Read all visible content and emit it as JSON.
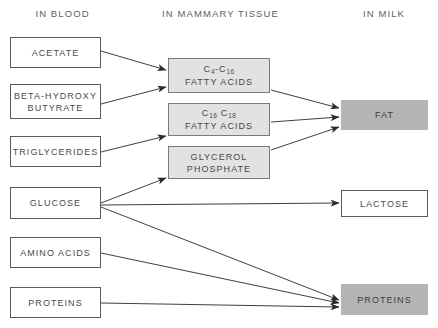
{
  "diagram": {
    "title_columns": [
      {
        "id": "in-blood",
        "label": "IN BLOOD",
        "x": 15,
        "y": 8,
        "w": 95
      },
      {
        "id": "in-mammary-tissue",
        "label": "IN MAMMARY TISSUE",
        "x": 148,
        "y": 8,
        "w": 145
      },
      {
        "id": "in-milk",
        "label": "IN MILK",
        "x": 338,
        "y": 8,
        "w": 92
      }
    ],
    "blood_nodes": [
      {
        "id": "acetate",
        "label": "ACETATE",
        "line2": "",
        "x": 10,
        "y": 37,
        "w": 91,
        "h": 31
      },
      {
        "id": "beta-hydroxy-butyrate",
        "label": "BETA-HYDROXY",
        "line2": "BUTYRATE",
        "x": 10,
        "y": 84,
        "w": 91,
        "h": 35
      },
      {
        "id": "triglycerides",
        "label": "TRIGLYCERIDES",
        "line2": "",
        "x": 10,
        "y": 136,
        "w": 91,
        "h": 31
      },
      {
        "id": "glucose",
        "label": "GLUCOSE",
        "line2": "",
        "x": 10,
        "y": 187,
        "w": 91,
        "h": 32
      },
      {
        "id": "amino-acids",
        "label": "AMINO ACIDS",
        "line2": "",
        "x": 10,
        "y": 237,
        "w": 91,
        "h": 31
      },
      {
        "id": "proteins-blood",
        "label": "PROTEINS",
        "line2": "",
        "x": 10,
        "y": 287,
        "w": 91,
        "h": 31
      }
    ],
    "tissue_nodes": [
      {
        "id": "c4-c16-fatty-acids",
        "label_html": "C<sub>4</sub>-C<sub>16</sub>",
        "line2": "FATTY ACIDS",
        "x": 168,
        "y": 58,
        "w": 102,
        "h": 35
      },
      {
        "id": "c16-c18-fatty-acids",
        "label_html": "C<sub>16</sub> C<sub>18</sub>",
        "line2": "FATTY ACIDS",
        "x": 168,
        "y": 103,
        "w": 102,
        "h": 33
      },
      {
        "id": "glycerol-phosphate",
        "label_html": "GLYCEROL",
        "line2": "PHOSPHATE",
        "x": 168,
        "y": 146,
        "w": 102,
        "h": 33
      }
    ],
    "milk_nodes": [
      {
        "id": "fat",
        "label": "FAT",
        "filled": true,
        "x": 341,
        "y": 100,
        "w": 87,
        "h": 30
      },
      {
        "id": "lactose",
        "label": "LACTOSE",
        "filled": false,
        "x": 341,
        "y": 190,
        "w": 87,
        "h": 27
      },
      {
        "id": "proteins-milk",
        "label": "PROTEINS",
        "filled": true,
        "x": 341,
        "y": 284,
        "w": 87,
        "h": 31
      }
    ],
    "edges": [
      {
        "id": "acetate-to-c4c16",
        "from": "acetate",
        "to": "c4-c16-fatty-acids",
        "x1": 101,
        "y1": 51,
        "x2": 166,
        "y2": 70
      },
      {
        "id": "beta-hydroxy-to-c4c16",
        "from": "beta-hydroxy-butyrate",
        "to": "c4-c16-fatty-acids",
        "x1": 101,
        "y1": 104,
        "x2": 166,
        "y2": 87
      },
      {
        "id": "triglycerides-to-c16c18",
        "from": "triglycerides",
        "to": "c16-c18-fatty-acids",
        "x1": 101,
        "y1": 152,
        "x2": 166,
        "y2": 136
      },
      {
        "id": "glucose-to-glycerol-phosphate",
        "from": "glucose",
        "to": "glycerol-phosphate",
        "x1": 101,
        "y1": 203,
        "x2": 166,
        "y2": 178
      },
      {
        "id": "c4c16-to-fat",
        "from": "c4-c16-fatty-acids",
        "to": "fat",
        "x1": 271,
        "y1": 90,
        "x2": 339,
        "y2": 108
      },
      {
        "id": "c16c18-to-fat",
        "from": "c16-c18-fatty-acids",
        "to": "fat",
        "x1": 271,
        "y1": 122,
        "x2": 339,
        "y2": 117
      },
      {
        "id": "glycerol-phosphate-to-fat",
        "from": "glycerol-phosphate",
        "to": "fat",
        "x1": 271,
        "y1": 150,
        "x2": 339,
        "y2": 127
      },
      {
        "id": "glucose-to-lactose",
        "from": "glucose",
        "to": "lactose",
        "x1": 101,
        "y1": 205,
        "x2": 339,
        "y2": 203
      },
      {
        "id": "glucose-to-proteins-milk",
        "from": "glucose",
        "to": "proteins-milk",
        "x1": 101,
        "y1": 207,
        "x2": 339,
        "y2": 300
      },
      {
        "id": "amino-acids-to-proteins-milk",
        "from": "amino-acids",
        "to": "proteins-milk",
        "x1": 101,
        "y1": 253,
        "x2": 339,
        "y2": 303
      },
      {
        "id": "proteins-blood-to-proteins-milk",
        "from": "proteins-blood",
        "to": "proteins-milk",
        "x1": 101,
        "y1": 303,
        "x2": 339,
        "y2": 307
      }
    ],
    "colors": {
      "tissue_fill": "#e2e2e2",
      "milk_fill": "#b4b4b4",
      "border": "#5a5a5a",
      "text": "#4a4a4a",
      "arrow": "#2a2a2a",
      "background": "#ffffff"
    }
  }
}
